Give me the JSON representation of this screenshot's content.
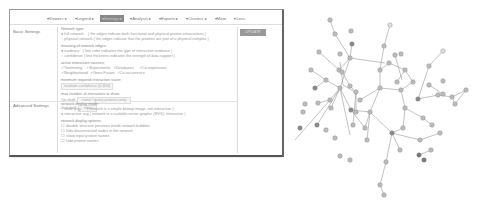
{
  "toolbar": {
    "items": [
      {
        "label": "▾Viewers ▸"
      },
      {
        "label": "▾Legend ▸"
      },
      {
        "label": "▾Settings ▸"
      },
      {
        "label": "▾Analysis ▸"
      },
      {
        "label": "▾Exports ▸"
      },
      {
        "label": "▾Clusters ▸"
      },
      {
        "label": "▾More"
      },
      {
        "label": "▾Less"
      }
    ],
    "active_index": 2
  },
  "basic_settings": {
    "label": "Basic Settings",
    "network_type": {
      "heading": "Network type:",
      "options": [
        {
          "label": "full network",
          "desc": "( the edges indicate both functional and physical protein associations )",
          "selected": true
        },
        {
          "label": "physical network",
          "desc": "( the edges indicate that the proteins are part of a physical complex )",
          "selected": false
        }
      ]
    },
    "edges_meaning": {
      "heading": "meaning of network edges:",
      "options": [
        {
          "label": "evidence",
          "desc": "( line color indicates the type of interaction evidence )",
          "selected": true
        },
        {
          "label": "confidence",
          "desc": "( line thickness indicates the strength of data support )",
          "selected": false
        }
      ]
    },
    "sources": {
      "heading": "active interaction sources:",
      "row1": [
        "✓Textmining",
        "✓Experiments",
        "✓Databases",
        "✓Co-expression"
      ],
      "row2": [
        "✓Neighborhood",
        "✓Gene Fusion",
        "✓Co-occurrence"
      ]
    },
    "min_score": {
      "heading": "minimum required interaction score:",
      "value": "medium confidence (0.400)"
    },
    "max_interactors": {
      "heading": "max number of interactors to show",
      "first_shell_label": "1st shell:",
      "first_shell_value": "- none / query proteins only -",
      "second_shell_label": "2nd shell:",
      "second_shell_value": "- none -"
    }
  },
  "advanced_settings": {
    "label": "Advanced Settings",
    "display_mode": {
      "heading": "network display mode:",
      "options": [
        {
          "label": "static png",
          "desc": "( network is a simple bitmap image, not interactive )",
          "selected": false
        },
        {
          "label": "interactive svg",
          "desc": "( network is a scalable vector graphic (SVG), interactive )",
          "selected": true
        }
      ]
    },
    "display_options": {
      "heading": "network display options:",
      "options": [
        "disable structure previews inside network bubbles",
        "hide disconnected nodes in the network",
        "show input protein names",
        "hide protein names"
      ]
    }
  },
  "update_button": {
    "label": "UPDATE"
  }
}
